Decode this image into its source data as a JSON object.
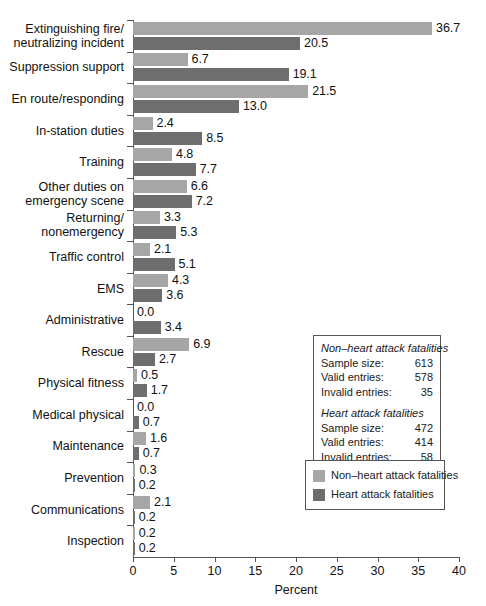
{
  "chart_data": {
    "type": "bar",
    "title": "",
    "orientation": "horizontal",
    "xlabel": "Percent",
    "ylabel": "",
    "xlim": [
      0,
      40
    ],
    "xticks": [
      0,
      5,
      10,
      15,
      20,
      25,
      30,
      35,
      40
    ],
    "xtick_labels": [
      "0",
      "5",
      "10",
      "15",
      "20",
      "25",
      "30",
      "35",
      "40"
    ],
    "grid": false,
    "legend_position": "right-lower",
    "categories": [
      "Extinguishing fire/\nneutralizing incident",
      "Suppression support",
      "En route/responding",
      "In-station duties",
      "Training",
      "Other duties on\nemergency scene",
      "Returning/\nnonemergency",
      "Traffic control",
      "EMS",
      "Administrative",
      "Rescue",
      "Physical fitness",
      "Medical physical",
      "Maintenance",
      "Prevention",
      "Communications",
      "Inspection"
    ],
    "series": [
      {
        "name": "Non-heart attack fatalities",
        "color": "#a6a6a6",
        "values": [
          36.7,
          6.7,
          21.5,
          2.4,
          4.8,
          6.6,
          3.3,
          2.1,
          4.3,
          0.0,
          6.9,
          0.5,
          0.0,
          1.6,
          0.3,
          2.1,
          0.2
        ],
        "labels": [
          "36.7",
          "6.7",
          "21.5",
          "2.4",
          "4.8",
          "6.6",
          "3.3",
          "2.1",
          "4.3",
          "0.0",
          "6.9",
          "0.5",
          "0.0",
          "1.6",
          "0.3",
          "2.1",
          "0.2"
        ]
      },
      {
        "name": "Heart attack fatalities",
        "color": "#6e6e6e",
        "values": [
          20.5,
          19.1,
          13.0,
          8.5,
          7.7,
          7.2,
          5.3,
          5.1,
          3.6,
          3.4,
          2.7,
          1.7,
          0.7,
          0.7,
          0.2,
          0.2,
          0.2
        ],
        "labels": [
          "20.5",
          "19.1",
          "13.0",
          "8.5",
          "7.7",
          "7.2",
          "5.3",
          "5.1",
          "3.6",
          "3.4",
          "2.7",
          "1.7",
          "0.7",
          "0.7",
          "0.2",
          "0.2",
          "0.2"
        ]
      }
    ]
  },
  "stats_box": {
    "group1": {
      "title": "Non–heart attack fatalities",
      "rows": [
        {
          "label": "Sample size:",
          "value": "613"
        },
        {
          "label": "Valid entries:",
          "value": "578"
        },
        {
          "label": "Invalid entries:",
          "value": "35"
        }
      ]
    },
    "group2": {
      "title": "Heart attack fatalities",
      "rows": [
        {
          "label": "Sample size:",
          "value": "472"
        },
        {
          "label": "Valid entries:",
          "value": "414"
        },
        {
          "label": "Invalid entries:",
          "value": "58"
        }
      ]
    }
  },
  "legend": {
    "items": [
      {
        "label": "Non–heart attack fatalities",
        "swatch": "light"
      },
      {
        "label": "Heart attack fatalities",
        "swatch": "dark"
      }
    ]
  },
  "colors": {
    "light_bar": "#a6a6a6",
    "dark_bar": "#6e6e6e",
    "axis": "#555555",
    "text": "#111111",
    "background": "#ffffff"
  }
}
